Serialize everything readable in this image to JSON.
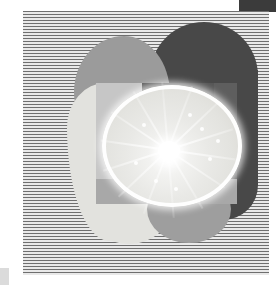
{
  "artwork": {
    "title": "Citrus Slice Collage",
    "medium": "photo-collage graphic",
    "canvas": {
      "width": 276,
      "height": 285,
      "background": "#ffffff"
    },
    "palette": {
      "paper_white": "#ffffff",
      "stripe_dark": "#6f6f6f",
      "stripe_light": "#e9e9e9",
      "dark_circle": "#484848",
      "corner_bar": "#3b3b3b",
      "mid_gray_blob": "#9b9b9b",
      "pale_blob": "#e2e2de",
      "gray_circle": "#9e9e9e",
      "photo_base": "#b9b9b9",
      "citrus_flesh": "#e9e9e6",
      "citrus_rind": "#ffffff"
    },
    "elements": [
      {
        "name": "corner-bar",
        "shape": "rectangle",
        "color": "#3b3b3b",
        "x": 239,
        "y": 0,
        "w": 37,
        "h": 12
      },
      {
        "name": "stripe-panel",
        "shape": "rectangle",
        "pattern": "horizontal-stripes",
        "x": 23,
        "y": 11,
        "w": 246,
        "h": 264,
        "stripe_period_px": 3
      },
      {
        "name": "dark-circle",
        "shape": "circle",
        "color": "#484848",
        "x": 150,
        "y": 22,
        "w": 108,
        "h": 108
      },
      {
        "name": "gray-blob",
        "shape": "organic-blob",
        "color": "#9b9b9b",
        "x": 74,
        "y": 36,
        "w": 96,
        "h": 112
      },
      {
        "name": "pale-blob",
        "shape": "organic-blob",
        "color": "#e2e2de",
        "x": 67,
        "y": 83,
        "w": 84,
        "h": 158
      },
      {
        "name": "gray-circle-bottom",
        "shape": "circle",
        "color": "#9e9e9e",
        "x": 147,
        "y": 175,
        "w": 84,
        "h": 68
      },
      {
        "name": "photo-rect",
        "shape": "rectangle",
        "color": "#b9b9b9",
        "x": 96,
        "y": 83,
        "w": 141,
        "h": 121
      },
      {
        "name": "citrus-slice",
        "shape": "ellipse",
        "color": "#e9e9e6",
        "x": 102,
        "y": 85,
        "w": 140,
        "h": 122,
        "segments": 14
      },
      {
        "name": "smudge",
        "shape": "rectangle",
        "color": "#cfcfcf",
        "x": 0,
        "y": 268,
        "w": 9,
        "h": 17
      }
    ]
  }
}
